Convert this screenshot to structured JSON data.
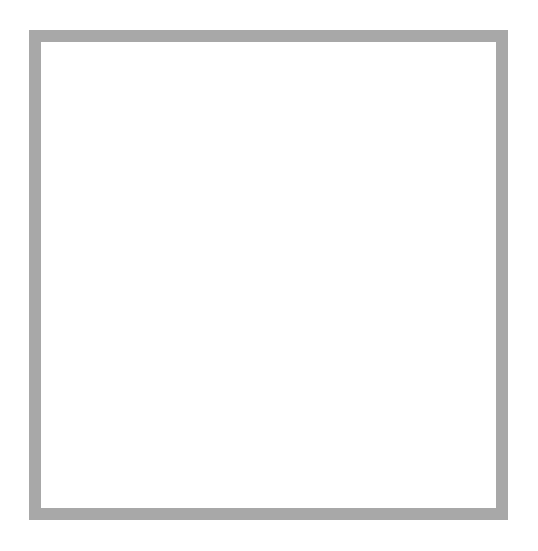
{
  "artwork": {
    "title": "Eight-Pointed Arrow Rosette",
    "medium_label": "Halftone dot screen print",
    "canvas": {
      "width": 538,
      "height": 551,
      "background_color": "#ffffff"
    }
  },
  "frame": {
    "name": "picture-frame",
    "color": "#a8a8a8",
    "inner_color": "#ffffff",
    "x": 29,
    "y": 30,
    "width": 479,
    "height": 490,
    "thickness": 12
  },
  "rosette": {
    "center_x": 270,
    "center_y": 277,
    "arrow_count": 8,
    "tip_radius": 218,
    "head_base_radius": 128,
    "shaft_half_width": 27,
    "head_half_width": 48,
    "shaft_inner_radius": 12,
    "rotation_offset_deg": 0,
    "arrow_angles_deg": [
      0,
      45,
      90,
      135,
      180,
      225,
      270,
      315
    ],
    "arrow_labels": [
      "arrow-up",
      "arrow-up-right",
      "arrow-right",
      "arrow-down-right",
      "arrow-down",
      "arrow-down-left",
      "arrow-left",
      "arrow-up-left"
    ],
    "fill_color": "#000000"
  },
  "halftone": {
    "pattern_name": "radial-dot-gradient",
    "dot_color": "#111111",
    "paper_color": "#ffffff",
    "cell_size": 8.5,
    "center_white_radius": 52,
    "full_black_radius": 210,
    "min_dot_ratio": 0.0,
    "max_dot_ratio": 0.86,
    "moire_rotation_deg": 7,
    "secondary_cell_size": 8.5,
    "description": "Dot size increases with distance from centre; two superimposed screens create flower-shaped moire rosettes."
  }
}
